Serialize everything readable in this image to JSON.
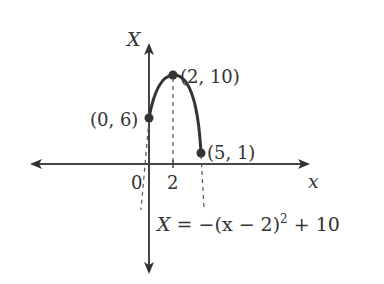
{
  "diagram": {
    "axes": {
      "horizontal_label": "x",
      "vertical_label": "X",
      "tick_labels": [
        "0",
        "2"
      ]
    },
    "points": [
      {
        "label": "(0, 6)",
        "x": 0,
        "y": 6
      },
      {
        "label": "(2, 10)",
        "x": 2,
        "y": 10
      },
      {
        "label": "(5, 1)",
        "x": 5,
        "y": 1
      }
    ],
    "equation": {
      "lhs": "X",
      "eq": "=",
      "body": "−(x − 2)",
      "exponent": "2",
      "tail": "+ 10"
    },
    "colors": {
      "ink": "#333333",
      "dash": "#555555"
    }
  }
}
